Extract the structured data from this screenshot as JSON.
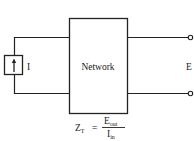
{
  "diagram": {
    "network_label": "Network",
    "source_label": "I",
    "output_label": "E",
    "formula": {
      "lhs": "Z",
      "lhs_sub": "T",
      "equals": "=",
      "numerator": "E",
      "numerator_sub": "out",
      "denominator": "I",
      "denominator_sub": "in"
    },
    "colors": {
      "line": "#222222",
      "background": "#ffffff"
    }
  }
}
